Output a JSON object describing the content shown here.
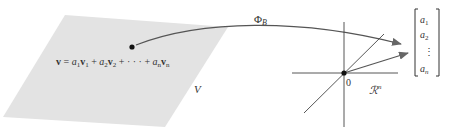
{
  "diagram": {
    "type": "coordinate-mapping",
    "plane": {
      "label": "V",
      "fill": "#e3e3e3",
      "equation": {
        "lhs": "v",
        "terms": [
          {
            "coef": "a",
            "coef_sub": "1",
            "vec": "v",
            "vec_sub": "1"
          },
          {
            "coef": "a",
            "coef_sub": "2",
            "vec": "v",
            "vec_sub": "2"
          },
          {
            "dots": "· · ·"
          },
          {
            "coef": "a",
            "coef_sub": "n",
            "vec": "v",
            "vec_sub": "n"
          }
        ],
        "text": "v = a1v1 + a2v2 + · · · + anvn"
      }
    },
    "mapping": {
      "label": "Φ",
      "label_sub": "B",
      "color": "#666666"
    },
    "target_space": {
      "label": "ℛ",
      "label_sup": "n",
      "origin_label": "0"
    },
    "coordinate_vector": {
      "entries": [
        "a1",
        "a2",
        "⋮",
        "an"
      ],
      "display": [
        {
          "base": "a",
          "sub": "1"
        },
        {
          "base": "a",
          "sub": "2"
        },
        {
          "base": "⋮",
          "sub": ""
        },
        {
          "base": "a",
          "sub": "n"
        }
      ]
    }
  }
}
